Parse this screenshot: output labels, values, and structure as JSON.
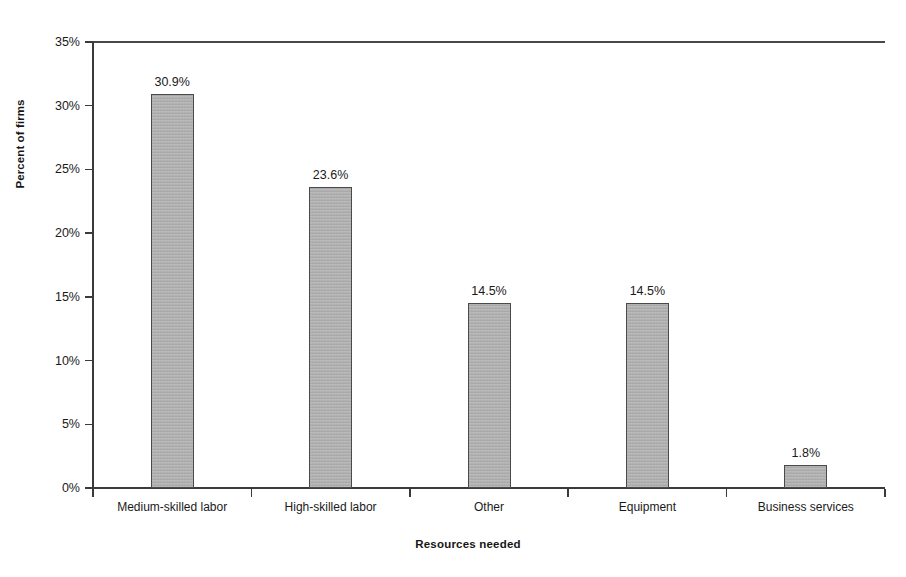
{
  "chart_data": {
    "type": "bar",
    "title": "",
    "xlabel": "Resources needed",
    "ylabel": "Percent of firms",
    "categories": [
      "Medium-skilled labor",
      "High-skilled labor",
      "Other",
      "Equipment",
      "Business services"
    ],
    "values": [
      30.9,
      23.6,
      14.5,
      14.5,
      1.8
    ],
    "data_labels": [
      "30.9%",
      "23.6%",
      "14.5%",
      "14.5%",
      "1.8%"
    ],
    "ylim": [
      0,
      35
    ],
    "ytick_values": [
      0,
      5,
      10,
      15,
      20,
      25,
      30,
      35
    ],
    "ytick_labels": [
      "0%",
      "5%",
      "10%",
      "15%",
      "20%",
      "25%",
      "30%",
      "35%"
    ],
    "grid": false,
    "legend": null,
    "bar_color": "#aaaaaa",
    "bar_border_color": "#4a4a4a",
    "axis_color": "#3a3a3a"
  }
}
